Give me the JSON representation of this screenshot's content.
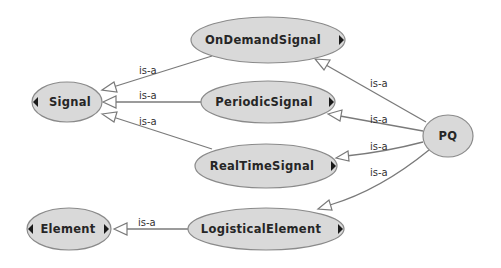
{
  "diagram": {
    "type": "ontology-class-hierarchy",
    "nodes": [
      {
        "id": "Signal",
        "label": "Signal",
        "cx": 67,
        "cy": 102,
        "rx": 35,
        "ry": 20,
        "expand_left": true,
        "expand_right": false
      },
      {
        "id": "Element",
        "label": "Element",
        "cx": 69,
        "cy": 229,
        "rx": 42,
        "ry": 21,
        "expand_left": true,
        "expand_right": true
      },
      {
        "id": "OnDemandSignal",
        "label": "OnDemandSignal",
        "cx": 268,
        "cy": 40,
        "rx": 77,
        "ry": 23,
        "expand_left": false,
        "expand_right": true
      },
      {
        "id": "PeriodicSignal",
        "label": "PeriodicSignal",
        "cx": 268,
        "cy": 102,
        "rx": 67,
        "ry": 21,
        "expand_left": false,
        "expand_right": true
      },
      {
        "id": "RealTimeSignal",
        "label": "RealTimeSignal",
        "cx": 266,
        "cy": 166,
        "rx": 71,
        "ry": 22,
        "expand_left": false,
        "expand_right": true
      },
      {
        "id": "LogisticalElement",
        "label": "LogisticalElement",
        "cx": 266,
        "cy": 229,
        "rx": 78,
        "ry": 21,
        "expand_left": false,
        "expand_right": true
      },
      {
        "id": "PQ",
        "label": "PQ",
        "cx": 448,
        "cy": 136,
        "rx": 25,
        "ry": 21,
        "expand_left": false,
        "expand_right": false
      }
    ],
    "edges": [
      {
        "from": "OnDemandSignal",
        "to": "Signal",
        "label": "is-a"
      },
      {
        "from": "PeriodicSignal",
        "to": "Signal",
        "label": "is-a"
      },
      {
        "from": "RealTimeSignal",
        "to": "Signal",
        "label": "is-a"
      },
      {
        "from": "LogisticalElement",
        "to": "Element",
        "label": "is-a"
      },
      {
        "from": "PQ",
        "to": "OnDemandSignal",
        "label": "is-a"
      },
      {
        "from": "PQ",
        "to": "PeriodicSignal",
        "label": "is-a"
      },
      {
        "from": "PQ",
        "to": "RealTimeSignal",
        "label": "is-a"
      },
      {
        "from": "PQ",
        "to": "LogisticalElement",
        "label": "is-a"
      }
    ],
    "colors": {
      "node_fill": "#d9d9d9",
      "node_stroke": "#8a8a8a",
      "edge": "#7a7a7a",
      "text": "#262626",
      "background": "#ffffff"
    }
  }
}
